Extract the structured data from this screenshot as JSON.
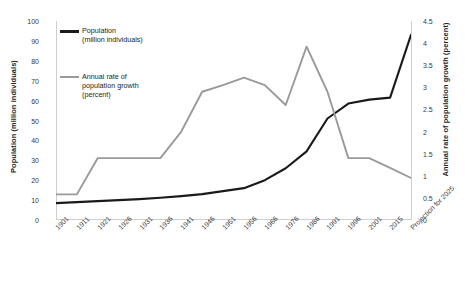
{
  "chart_data": {
    "type": "line",
    "title": "",
    "xlabel": "",
    "ylabel": "Population (million individuals)",
    "y2label": "Annual rate of population growth (percent)",
    "grid": false,
    "legend_position": "top-left",
    "ylim": [
      0,
      100
    ],
    "y2lim": [
      0,
      4.5
    ],
    "yticks": [
      "0",
      "10",
      "20",
      "30",
      "40",
      "50",
      "60",
      "70",
      "80",
      "90",
      "100"
    ],
    "y2ticks": [
      "0",
      "0.5",
      "1",
      "1.5",
      "2",
      "2.5",
      "3",
      "3.5",
      "4",
      "4.5"
    ],
    "categories": [
      "1901",
      "1911",
      "1921",
      "1926",
      "1931",
      "1936",
      "1941",
      "1946",
      "1951",
      "1956",
      "1966",
      "1976",
      "1986",
      "1991",
      "1996",
      "2001",
      "2015",
      "Projection for 2025"
    ],
    "series": [
      {
        "name": "Population",
        "unit": "(million individuals)",
        "legend_label_line1": "Population",
        "legend_label_line2": "(million individuals)",
        "color": "#1a1a1a",
        "axis": "left",
        "values": [
          8.5,
          9.0,
          9.5,
          10.0,
          10.5,
          11.2,
          12.0,
          13.0,
          14.5,
          16.0,
          20.0,
          26.0,
          34.5,
          51.0,
          58.5,
          60.5,
          61.5,
          93.0
        ]
      },
      {
        "name": "Annual rate of population growth",
        "unit": "(percent)",
        "legend_label_line1": "Annual rate of",
        "legend_label_line2": "population growth",
        "legend_label_line3": "(percent)",
        "color": "#9a9a9a",
        "axis": "right",
        "values": [
          0.58,
          0.58,
          1.4,
          1.4,
          1.4,
          1.4,
          2.0,
          2.9,
          3.05,
          3.22,
          3.05,
          2.6,
          3.92,
          2.9,
          1.4,
          1.4,
          1.18,
          0.95
        ]
      }
    ]
  }
}
